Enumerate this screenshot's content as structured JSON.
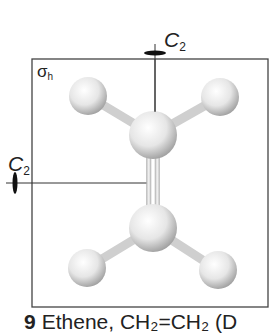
{
  "figure": {
    "number": "9",
    "caption": "Ethene, CH₂=CH₂ (D",
    "caption_visible": "Ethene, CH₂=CH₂ (D",
    "labels": {
      "c2_vertical": {
        "main": "C",
        "sub": "2"
      },
      "c2_horizontal": {
        "main": "C",
        "sub": "2"
      },
      "mirror_plane": {
        "main": "σ",
        "sub": "h"
      }
    }
  },
  "colors": {
    "line": "#333333",
    "atom_light": "#ffffff",
    "atom_dark": "#9a9a9a"
  }
}
